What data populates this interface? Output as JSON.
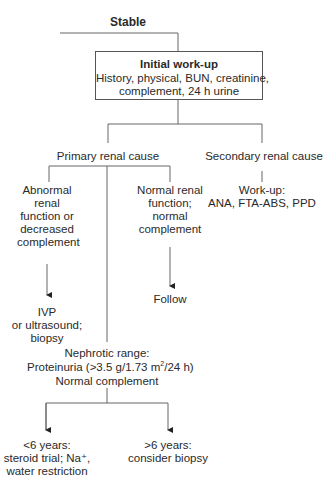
{
  "diagram": {
    "stable_label": "Stable",
    "initial_workup": {
      "title": "Initial work-up",
      "line1": "History, physical, BUN, creatinine,",
      "line2": "complement, 24 h urine"
    },
    "primary": {
      "label": "Primary renal cause",
      "abnormal": {
        "lines": [
          "Abnormal",
          "renal",
          "function or",
          "decreased",
          "complement"
        ]
      },
      "abnormal_action": {
        "lines": [
          "IVP",
          "or ultrasound;",
          "biopsy"
        ]
      },
      "normal": {
        "lines": [
          "Normal renal",
          "function;",
          "normal",
          "complement"
        ]
      },
      "normal_action": "Follow",
      "nephrotic": {
        "line1": "Nephrotic range:",
        "line2_pre": "Proteinuria (>3.5 g/1.73 m",
        "line2_sup": "2",
        "line2_post": "/24 h)",
        "line3": "Normal complement"
      },
      "under6": {
        "line1": "<6 years:",
        "line2": "steroid trial; Na⁺,",
        "line3": "water restriction"
      },
      "over6": {
        "line1": ">6 years:",
        "line2": "consider biopsy"
      }
    },
    "secondary": {
      "label": "Secondary renal cause",
      "workup_title": "Work-up:",
      "workup_tests": "ANA, FTA-ABS, PPD"
    }
  }
}
